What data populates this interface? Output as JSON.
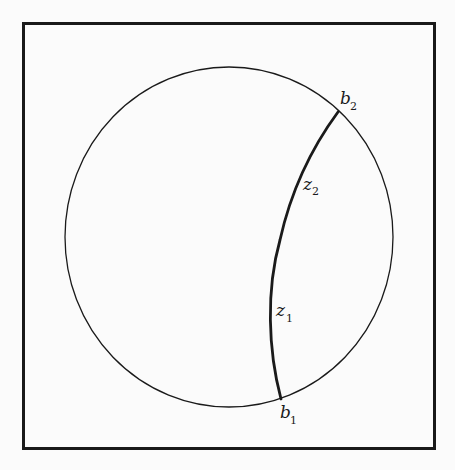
{
  "figure": {
    "type": "geometric-diagram",
    "colors": {
      "background": "#fbfbfb",
      "stroke": "#1a1a1a"
    },
    "frame": {
      "x": 23,
      "y": 23,
      "width": 412,
      "height": 426
    },
    "circle": {
      "cx": 229,
      "cy": 237,
      "rx": 164,
      "ry": 170
    },
    "arc": {
      "start": "b1",
      "end": "b2",
      "through": [
        "z1",
        "z2"
      ]
    },
    "labels": {
      "b2": {
        "base": "b",
        "sub": "2"
      },
      "z2": {
        "base": "z",
        "sub": "2"
      },
      "z1": {
        "base": "z",
        "sub": "1"
      },
      "b1": {
        "base": "b",
        "sub": "1"
      }
    }
  }
}
